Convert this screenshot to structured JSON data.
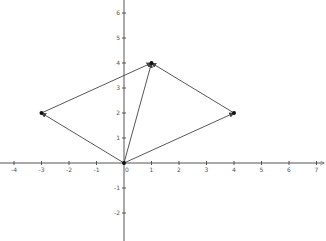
{
  "chart_data": {
    "type": "vector-diagram",
    "title": "",
    "xlabel": "",
    "ylabel": "",
    "xlim": [
      -4.5,
      7.2
    ],
    "ylim": [
      -2.8,
      6.5
    ],
    "x_ticks": [
      -4,
      -3,
      -2,
      -1,
      0,
      1,
      2,
      3,
      4,
      5,
      6,
      7
    ],
    "y_ticks": [
      -2,
      -1,
      1,
      2,
      3,
      4,
      5,
      6
    ],
    "grid": false,
    "points": [
      {
        "name": "O",
        "x": 0,
        "y": 0
      },
      {
        "name": "A",
        "x": -3,
        "y": 2
      },
      {
        "name": "B",
        "x": 1,
        "y": 4
      },
      {
        "name": "C",
        "x": 4,
        "y": 2
      }
    ],
    "vectors": [
      {
        "from": [
          0,
          0
        ],
        "to": [
          -3,
          2
        ]
      },
      {
        "from": [
          0,
          0
        ],
        "to": [
          4,
          2
        ]
      },
      {
        "from": [
          0,
          0
        ],
        "to": [
          1,
          4
        ]
      },
      {
        "from": [
          -3,
          2
        ],
        "to": [
          1,
          4
        ]
      },
      {
        "from": [
          4,
          2
        ],
        "to": [
          1,
          4
        ]
      }
    ],
    "colors": {
      "axis": "#555555",
      "vector": "#444444",
      "point": "#111111"
    }
  }
}
